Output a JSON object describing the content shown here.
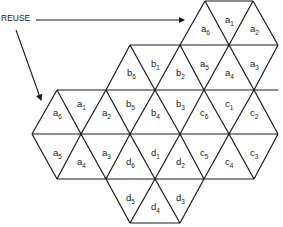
{
  "diagram": {
    "type": "hexagonal triangle tiling showing frequency reuse",
    "annotation": {
      "label": "REUSE",
      "arrows": [
        "to upper-right hexagon a",
        "to left hexagon a"
      ]
    },
    "line_color": "#1a1a1a",
    "cells": [
      {
        "id": "a1",
        "letter": "a",
        "sub": "1",
        "x": 229,
        "y": 20
      },
      {
        "id": "a6",
        "letter": "a",
        "sub": "6",
        "x": 205,
        "y": 29
      },
      {
        "id": "a2",
        "letter": "a",
        "sub": "2",
        "x": 254,
        "y": 29
      },
      {
        "id": "b1",
        "letter": "b",
        "sub": "1",
        "x": 155,
        "y": 64
      },
      {
        "id": "b6",
        "letter": "b",
        "sub": "6",
        "x": 131,
        "y": 73
      },
      {
        "id": "b2",
        "letter": "b",
        "sub": "2",
        "x": 180,
        "y": 73
      },
      {
        "id": "a5",
        "letter": "a",
        "sub": "5",
        "x": 204,
        "y": 64
      },
      {
        "id": "a4",
        "letter": "a",
        "sub": "4",
        "x": 229,
        "y": 73
      },
      {
        "id": "a3",
        "letter": "a",
        "sub": "3",
        "x": 254,
        "y": 64
      },
      {
        "id": "a1b",
        "letter": "a",
        "sub": "1",
        "x": 81,
        "y": 104
      },
      {
        "id": "a6b",
        "letter": "a",
        "sub": "6",
        "x": 57,
        "y": 113
      },
      {
        "id": "a2b",
        "letter": "a",
        "sub": "2",
        "x": 106,
        "y": 113
      },
      {
        "id": "b5",
        "letter": "b",
        "sub": "5",
        "x": 130,
        "y": 104
      },
      {
        "id": "b4",
        "letter": "b",
        "sub": "4",
        "x": 155,
        "y": 113
      },
      {
        "id": "b3",
        "letter": "b",
        "sub": "3",
        "x": 180,
        "y": 104
      },
      {
        "id": "c6",
        "letter": "c",
        "sub": "6",
        "x": 204,
        "y": 113
      },
      {
        "id": "c1",
        "letter": "c",
        "sub": "1",
        "x": 229,
        "y": 104
      },
      {
        "id": "c2",
        "letter": "c",
        "sub": "2",
        "x": 254,
        "y": 113
      },
      {
        "id": "a5b",
        "letter": "a",
        "sub": "5",
        "x": 57,
        "y": 153
      },
      {
        "id": "a4b",
        "letter": "a",
        "sub": "4",
        "x": 81,
        "y": 162
      },
      {
        "id": "a3b",
        "letter": "a",
        "sub": "3",
        "x": 106,
        "y": 153
      },
      {
        "id": "d6",
        "letter": "d",
        "sub": "6",
        "x": 130,
        "y": 162
      },
      {
        "id": "d1",
        "letter": "d",
        "sub": "1",
        "x": 155,
        "y": 153
      },
      {
        "id": "d2",
        "letter": "d",
        "sub": "2",
        "x": 180,
        "y": 162
      },
      {
        "id": "c5",
        "letter": "c",
        "sub": "5",
        "x": 204,
        "y": 153
      },
      {
        "id": "c4",
        "letter": "c",
        "sub": "4",
        "x": 229,
        "y": 162
      },
      {
        "id": "c3",
        "letter": "c",
        "sub": "3",
        "x": 254,
        "y": 153
      },
      {
        "id": "d5",
        "letter": "d",
        "sub": "5",
        "x": 130,
        "y": 198
      },
      {
        "id": "d4",
        "letter": "d",
        "sub": "4",
        "x": 155,
        "y": 207
      },
      {
        "id": "d3",
        "letter": "d",
        "sub": "3",
        "x": 180,
        "y": 198
      }
    ]
  }
}
